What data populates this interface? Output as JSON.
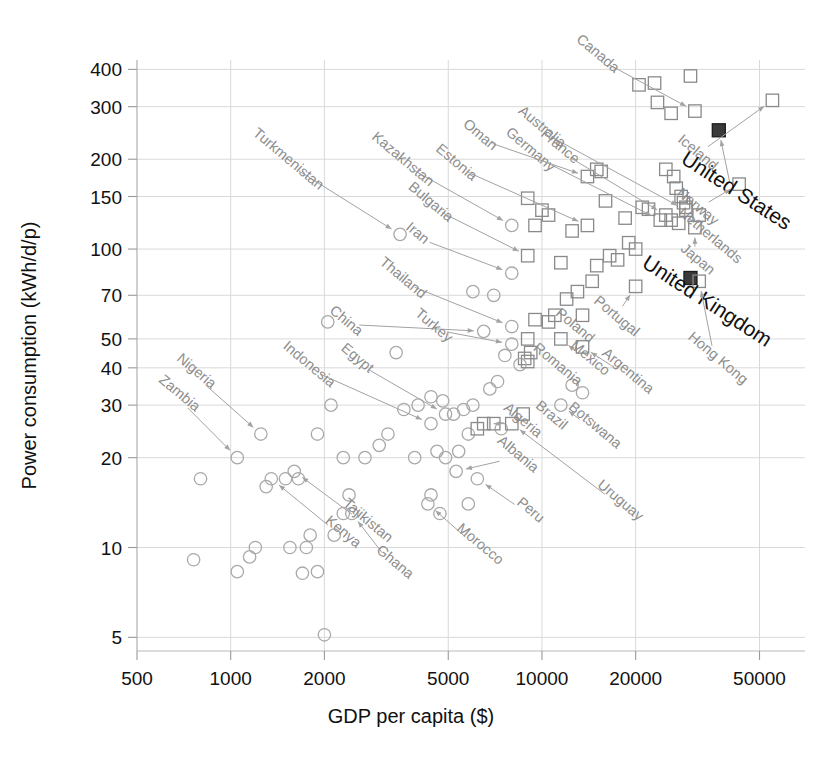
{
  "chart_data": {
    "type": "scatter",
    "title": "",
    "xlabel": "GDP per capita ($)",
    "ylabel": "Power consumption (kWh/d/p)",
    "xscale": "log",
    "yscale": "log",
    "xlim": [
      500,
      70000
    ],
    "ylim": [
      4.5,
      430
    ],
    "grid": true,
    "legend": "none",
    "xticks": [
      500,
      1000,
      2000,
      5000,
      10000,
      20000,
      50000
    ],
    "xtick_labels": [
      "500",
      "1000",
      "2000",
      "5000",
      "10000",
      "20000",
      "50000"
    ],
    "yticks": [
      5,
      10,
      20,
      30,
      40,
      50,
      70,
      100,
      150,
      200,
      300,
      400
    ],
    "ytick_labels": [
      "5",
      "10",
      "20",
      "30",
      "40",
      "50",
      "70",
      "100",
      "150",
      "200",
      "300",
      "400"
    ],
    "marker_kinds": {
      "circle": "lower-consumption countries (open circle)",
      "square": "higher-consumption countries (open square)",
      "filled": "highlighted country (filled square)"
    },
    "labeled_points": [
      {
        "name": "Canada",
        "x": 31000,
        "y": 290,
        "marker": "square",
        "label_x": 14800,
        "label_y": 440
      },
      {
        "name": "Iceland",
        "x": 55000,
        "y": 315,
        "marker": "square",
        "label_x": 31000,
        "label_y": 205
      },
      {
        "name": "United States",
        "x": 37000,
        "y": 250,
        "marker": "filled",
        "label_x": 41000,
        "label_y": 150
      },
      {
        "name": "Australia",
        "x": 29000,
        "y": 135,
        "marker": "square",
        "label_x": 9800,
        "label_y": 250
      },
      {
        "name": "Norway",
        "x": 43000,
        "y": 165,
        "marker": "square",
        "label_x": 31000,
        "label_y": 135
      },
      {
        "name": "Netherlands",
        "x": 32000,
        "y": 130,
        "marker": "square",
        "label_x": 34000,
        "label_y": 108
      },
      {
        "name": "Japan",
        "x": 31000,
        "y": 118,
        "marker": "square",
        "label_x": 31000,
        "label_y": 90
      },
      {
        "name": "United Kingdom",
        "x": 30000,
        "y": 80,
        "marker": "filled",
        "label_x": 33000,
        "label_y": 64
      },
      {
        "name": "Hong Kong",
        "x": 32000,
        "y": 78,
        "marker": "square",
        "label_x": 36000,
        "label_y": 42
      },
      {
        "name": "France",
        "x": 25000,
        "y": 130,
        "marker": "square",
        "label_x": 11200,
        "label_y": 215
      },
      {
        "name": "Germany",
        "x": 24000,
        "y": 125,
        "marker": "square",
        "label_x": 9000,
        "label_y": 210
      },
      {
        "name": "Oman",
        "x": 14000,
        "y": 175,
        "marker": "square",
        "label_x": 6200,
        "label_y": 235
      },
      {
        "name": "Estonia",
        "x": 14000,
        "y": 120,
        "marker": "square",
        "label_x": 5200,
        "label_y": 190
      },
      {
        "name": "Turkmenistan",
        "x": 3500,
        "y": 112,
        "marker": "circle",
        "label_x": 1500,
        "label_y": 195
      },
      {
        "name": "Kazakhstan",
        "x": 8000,
        "y": 120,
        "marker": "circle",
        "label_x": 3500,
        "label_y": 195
      },
      {
        "name": "Bulgaria",
        "x": 9000,
        "y": 95,
        "marker": "square",
        "label_x": 4300,
        "label_y": 140
      },
      {
        "name": "Iran",
        "x": 8000,
        "y": 83,
        "marker": "circle",
        "label_x": 3900,
        "label_y": 110
      },
      {
        "name": "Thailand",
        "x": 8000,
        "y": 55,
        "marker": "circle",
        "label_x": 3500,
        "label_y": 78
      },
      {
        "name": "China",
        "x": 6500,
        "y": 53,
        "marker": "circle",
        "label_x": 2300,
        "label_y": 56
      },
      {
        "name": "Turkey",
        "x": 8000,
        "y": 48,
        "marker": "circle",
        "label_x": 4400,
        "label_y": 54
      },
      {
        "name": "Poland",
        "x": 13500,
        "y": 60,
        "marker": "square",
        "label_x": 12500,
        "label_y": 54
      },
      {
        "name": "Portugal",
        "x": 20000,
        "y": 75,
        "marker": "square",
        "label_x": 17000,
        "label_y": 58
      },
      {
        "name": "Mexico",
        "x": 11500,
        "y": 50,
        "marker": "square",
        "label_x": 14000,
        "label_y": 42
      },
      {
        "name": "Argentina",
        "x": 13500,
        "y": 47,
        "marker": "square",
        "label_x": 18500,
        "label_y": 38
      },
      {
        "name": "Romania",
        "x": 9000,
        "y": 42,
        "marker": "square",
        "label_x": 11000,
        "label_y": 40
      },
      {
        "name": "Brazil",
        "x": 8700,
        "y": 28,
        "marker": "square",
        "label_x": 10500,
        "label_y": 27
      },
      {
        "name": "Botswana",
        "x": 11500,
        "y": 30,
        "marker": "circle",
        "label_x": 14500,
        "label_y": 25
      },
      {
        "name": "Algeria",
        "x": 6500,
        "y": 26,
        "marker": "square",
        "label_x": 8500,
        "label_y": 26
      },
      {
        "name": "Uruguay",
        "x": 8000,
        "y": 26,
        "marker": "square",
        "label_x": 17500,
        "label_y": 14
      },
      {
        "name": "Albania",
        "x": 5300,
        "y": 18,
        "marker": "circle",
        "label_x": 8200,
        "label_y": 20
      },
      {
        "name": "Peru",
        "x": 6200,
        "y": 17,
        "marker": "circle",
        "label_x": 9000,
        "label_y": 13
      },
      {
        "name": "Morocco",
        "x": 4300,
        "y": 14,
        "marker": "circle",
        "label_x": 6200,
        "label_y": 10
      },
      {
        "name": "Ghana",
        "x": 2450,
        "y": 13,
        "marker": "circle",
        "label_x": 3300,
        "label_y": 8.7
      },
      {
        "name": "Tajikistan",
        "x": 1600,
        "y": 18,
        "marker": "circle",
        "label_x": 2700,
        "label_y": 12
      },
      {
        "name": "Kenya",
        "x": 1350,
        "y": 17,
        "marker": "circle",
        "label_x": 2250,
        "label_y": 11
      },
      {
        "name": "Nigeria",
        "x": 1250,
        "y": 24,
        "marker": "circle",
        "label_x": 760,
        "label_y": 38
      },
      {
        "name": "Zambia",
        "x": 1050,
        "y": 20,
        "marker": "circle",
        "label_x": 670,
        "label_y": 32
      },
      {
        "name": "Indonesia",
        "x": 4400,
        "y": 26,
        "marker": "circle",
        "label_x": 1750,
        "label_y": 40
      },
      {
        "name": "Egypt",
        "x": 4900,
        "y": 28,
        "marker": "circle",
        "label_x": 2500,
        "label_y": 42
      }
    ],
    "unlabeled_points": [
      {
        "x": 30000,
        "y": 380,
        "marker": "square"
      },
      {
        "x": 20500,
        "y": 355,
        "marker": "square"
      },
      {
        "x": 23000,
        "y": 360,
        "marker": "square"
      },
      {
        "x": 23500,
        "y": 310,
        "marker": "square"
      },
      {
        "x": 26000,
        "y": 285,
        "marker": "square"
      },
      {
        "x": 25000,
        "y": 185,
        "marker": "square"
      },
      {
        "x": 26500,
        "y": 175,
        "marker": "square"
      },
      {
        "x": 27000,
        "y": 160,
        "marker": "square"
      },
      {
        "x": 28000,
        "y": 150,
        "marker": "square"
      },
      {
        "x": 28500,
        "y": 143,
        "marker": "square"
      },
      {
        "x": 29000,
        "y": 138,
        "marker": "square"
      },
      {
        "x": 26000,
        "y": 125,
        "marker": "square"
      },
      {
        "x": 27500,
        "y": 122,
        "marker": "square"
      },
      {
        "x": 21000,
        "y": 138,
        "marker": "square"
      },
      {
        "x": 22000,
        "y": 136,
        "marker": "square"
      },
      {
        "x": 18500,
        "y": 127,
        "marker": "square"
      },
      {
        "x": 19000,
        "y": 105,
        "marker": "square"
      },
      {
        "x": 20000,
        "y": 100,
        "marker": "square"
      },
      {
        "x": 16500,
        "y": 95,
        "marker": "square"
      },
      {
        "x": 17500,
        "y": 92,
        "marker": "square"
      },
      {
        "x": 15000,
        "y": 88,
        "marker": "square"
      },
      {
        "x": 14500,
        "y": 78,
        "marker": "square"
      },
      {
        "x": 13000,
        "y": 72,
        "marker": "square"
      },
      {
        "x": 12000,
        "y": 68,
        "marker": "square"
      },
      {
        "x": 11000,
        "y": 60,
        "marker": "square"
      },
      {
        "x": 10500,
        "y": 57,
        "marker": "square"
      },
      {
        "x": 11500,
        "y": 90,
        "marker": "square"
      },
      {
        "x": 12500,
        "y": 115,
        "marker": "square"
      },
      {
        "x": 16000,
        "y": 145,
        "marker": "square"
      },
      {
        "x": 15000,
        "y": 185,
        "marker": "square"
      },
      {
        "x": 15500,
        "y": 182,
        "marker": "square"
      },
      {
        "x": 10000,
        "y": 135,
        "marker": "square"
      },
      {
        "x": 10500,
        "y": 130,
        "marker": "square"
      },
      {
        "x": 9500,
        "y": 120,
        "marker": "square"
      },
      {
        "x": 9000,
        "y": 148,
        "marker": "square"
      },
      {
        "x": 7000,
        "y": 70,
        "marker": "circle"
      },
      {
        "x": 6000,
        "y": 72,
        "marker": "circle"
      },
      {
        "x": 9500,
        "y": 58,
        "marker": "square"
      },
      {
        "x": 9000,
        "y": 50,
        "marker": "square"
      },
      {
        "x": 9200,
        "y": 45,
        "marker": "square"
      },
      {
        "x": 8800,
        "y": 43,
        "marker": "square"
      },
      {
        "x": 8500,
        "y": 41,
        "marker": "circle"
      },
      {
        "x": 7600,
        "y": 44,
        "marker": "circle"
      },
      {
        "x": 7200,
        "y": 36,
        "marker": "circle"
      },
      {
        "x": 6800,
        "y": 34,
        "marker": "circle"
      },
      {
        "x": 6000,
        "y": 30,
        "marker": "circle"
      },
      {
        "x": 5600,
        "y": 29,
        "marker": "circle"
      },
      {
        "x": 5200,
        "y": 28,
        "marker": "circle"
      },
      {
        "x": 4800,
        "y": 31,
        "marker": "circle"
      },
      {
        "x": 4400,
        "y": 32,
        "marker": "circle"
      },
      {
        "x": 4000,
        "y": 30,
        "marker": "circle"
      },
      {
        "x": 3600,
        "y": 29,
        "marker": "circle"
      },
      {
        "x": 3200,
        "y": 24,
        "marker": "circle"
      },
      {
        "x": 3000,
        "y": 22,
        "marker": "circle"
      },
      {
        "x": 2700,
        "y": 20,
        "marker": "circle"
      },
      {
        "x": 2300,
        "y": 20,
        "marker": "circle"
      },
      {
        "x": 2050,
        "y": 57,
        "marker": "circle"
      },
      {
        "x": 3400,
        "y": 45,
        "marker": "circle"
      },
      {
        "x": 2100,
        "y": 30,
        "marker": "circle"
      },
      {
        "x": 1900,
        "y": 24,
        "marker": "circle"
      },
      {
        "x": 1650,
        "y": 17,
        "marker": "circle"
      },
      {
        "x": 1500,
        "y": 17,
        "marker": "circle"
      },
      {
        "x": 1300,
        "y": 16,
        "marker": "circle"
      },
      {
        "x": 2400,
        "y": 15,
        "marker": "circle"
      },
      {
        "x": 2300,
        "y": 13,
        "marker": "circle"
      },
      {
        "x": 2150,
        "y": 11,
        "marker": "circle"
      },
      {
        "x": 1800,
        "y": 11,
        "marker": "circle"
      },
      {
        "x": 1750,
        "y": 10,
        "marker": "circle"
      },
      {
        "x": 1550,
        "y": 10,
        "marker": "circle"
      },
      {
        "x": 1200,
        "y": 10,
        "marker": "circle"
      },
      {
        "x": 1150,
        "y": 9.3,
        "marker": "circle"
      },
      {
        "x": 1050,
        "y": 8.3,
        "marker": "circle"
      },
      {
        "x": 760,
        "y": 9.1,
        "marker": "circle"
      },
      {
        "x": 800,
        "y": 17,
        "marker": "circle"
      },
      {
        "x": 1700,
        "y": 8.2,
        "marker": "circle"
      },
      {
        "x": 1900,
        "y": 8.3,
        "marker": "circle"
      },
      {
        "x": 2000,
        "y": 5.1,
        "marker": "circle"
      },
      {
        "x": 4600,
        "y": 21,
        "marker": "circle"
      },
      {
        "x": 4900,
        "y": 20,
        "marker": "circle"
      },
      {
        "x": 5400,
        "y": 21,
        "marker": "circle"
      },
      {
        "x": 5800,
        "y": 24,
        "marker": "circle"
      },
      {
        "x": 3900,
        "y": 20,
        "marker": "circle"
      },
      {
        "x": 4700,
        "y": 13,
        "marker": "circle"
      },
      {
        "x": 4400,
        "y": 15,
        "marker": "circle"
      },
      {
        "x": 5800,
        "y": 14,
        "marker": "circle"
      },
      {
        "x": 7400,
        "y": 25,
        "marker": "circle"
      },
      {
        "x": 7000,
        "y": 26,
        "marker": "square"
      },
      {
        "x": 6200,
        "y": 25,
        "marker": "square"
      },
      {
        "x": 12500,
        "y": 35,
        "marker": "circle"
      },
      {
        "x": 13500,
        "y": 33,
        "marker": "circle"
      }
    ]
  }
}
